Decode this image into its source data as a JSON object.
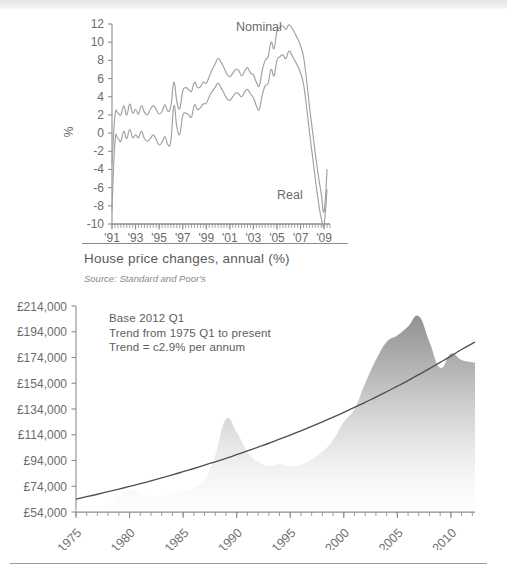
{
  "figure1": {
    "caption": "House price changes, annual (%)",
    "source": "Source: Standard and Poor's",
    "y_axis_label": "%",
    "series_label_nominal": "Nominal",
    "series_label_real": "Real"
  },
  "figure2": {
    "annotation": "Base 2012 Q1\nTrend from 1975 Q1 to present\nTrend = c2.9% per annum"
  },
  "colors": {
    "line": "#9a9a9a",
    "trend": "#4f4f4f",
    "area_top": "#8f8f8f",
    "area_bottom": "#fbfbfb",
    "text": "#5a5a5a",
    "axis": "#8d8d8d"
  },
  "chart_data": [
    {
      "type": "line",
      "title": "House price changes, annual (%)",
      "subtitle": "Source: Standard and Poor's",
      "xlabel": "",
      "ylabel": "%",
      "ylim": [
        -10,
        12
      ],
      "yticks": [
        "12",
        "10",
        "8",
        "6",
        "4",
        "2",
        "0",
        "-2",
        "-4",
        "-6",
        "-8",
        "-10"
      ],
      "ytick_values": [
        12,
        10,
        8,
        6,
        4,
        2,
        0,
        -2,
        -4,
        -6,
        -8,
        -10
      ],
      "xlim": [
        1991,
        2009.5
      ],
      "xticks": [
        "'91",
        "'93",
        "'95",
        "'97",
        "'99",
        "'01",
        "'03",
        "'05",
        "'07",
        "'09"
      ],
      "xtick_values": [
        1991,
        1993,
        1995,
        1997,
        1999,
        2001,
        2003,
        2005,
        2007,
        2009
      ],
      "grid": false,
      "legend": "inline-annotations",
      "x": [
        1991.0,
        1991.25,
        1991.5,
        1991.75,
        1992.0,
        1992.25,
        1992.5,
        1992.75,
        1993.0,
        1993.25,
        1993.5,
        1993.75,
        1994.0,
        1994.25,
        1994.5,
        1994.75,
        1995.0,
        1995.25,
        1995.5,
        1995.75,
        1996.0,
        1996.25,
        1996.5,
        1996.75,
        1997.0,
        1997.25,
        1997.5,
        1997.75,
        1998.0,
        1998.25,
        1998.5,
        1998.75,
        1999.0,
        1999.25,
        1999.5,
        1999.75,
        2000.0,
        2000.25,
        2000.5,
        2000.75,
        2001.0,
        2001.25,
        2001.5,
        2001.75,
        2002.0,
        2002.25,
        2002.5,
        2002.75,
        2003.0,
        2003.25,
        2003.5,
        2003.75,
        2004.0,
        2004.25,
        2004.5,
        2004.75,
        2005.0,
        2005.25,
        2005.5,
        2005.75,
        2006.0,
        2006.25,
        2006.5,
        2006.75,
        2007.0,
        2007.25,
        2007.5,
        2007.75,
        2008.0,
        2008.25,
        2008.5,
        2008.75,
        2009.0,
        2009.25
      ],
      "series": [
        {
          "name": "Nominal",
          "values": [
            -3.4,
            1.9,
            2.2,
            2.0,
            3.0,
            2.0,
            3.2,
            2.2,
            2.6,
            2.1,
            3.0,
            2.3,
            2.0,
            2.6,
            3.0,
            2.6,
            2.1,
            2.4,
            3.1,
            2.4,
            3.0,
            5.6,
            3.5,
            2.7,
            4.6,
            5.0,
            4.8,
            4.6,
            5.6,
            5.0,
            5.1,
            5.6,
            5.5,
            6.2,
            7.0,
            7.6,
            8.2,
            7.8,
            7.2,
            6.5,
            6.2,
            6.6,
            7.0,
            6.9,
            6.3,
            6.8,
            7.2,
            6.6,
            6.4,
            5.6,
            5.2,
            6.9,
            8.0,
            8.4,
            10.0,
            9.3,
            11.2,
            11.6,
            11.8,
            11.4,
            11.9,
            11.6,
            11.0,
            10.4,
            9.6,
            8.4,
            6.0,
            3.0,
            0.4,
            -2.2,
            -4.6,
            -6.6,
            -8.6,
            -4.0
          ]
        },
        {
          "name": "Real",
          "values": [
            -8.4,
            -1.0,
            -0.6,
            -0.9,
            0.2,
            -0.6,
            0.4,
            -0.5,
            -0.2,
            -0.5,
            0.2,
            -0.6,
            -0.9,
            -0.6,
            -0.2,
            -0.7,
            -1.3,
            -1.0,
            -0.4,
            -1.3,
            -0.8,
            3.0,
            0.7,
            -0.1,
            1.9,
            2.2,
            2.0,
            1.8,
            3.1,
            2.6,
            2.8,
            3.2,
            3.3,
            4.0,
            4.6,
            5.0,
            5.5,
            5.0,
            4.4,
            3.8,
            3.6,
            4.0,
            4.4,
            4.3,
            4.0,
            4.5,
            4.8,
            4.3,
            3.9,
            3.0,
            2.6,
            4.2,
            5.2,
            5.5,
            7.0,
            6.3,
            8.0,
            8.4,
            8.6,
            8.2,
            9.0,
            8.6,
            8.0,
            7.4,
            6.6,
            5.4,
            3.0,
            0.2,
            -2.4,
            -5.0,
            -7.4,
            -9.3,
            -10.0,
            -6.2
          ]
        }
      ]
    },
    {
      "type": "area",
      "title": "",
      "xlabel": "",
      "ylabel": "",
      "ylim": [
        54000,
        214000
      ],
      "yticks": [
        "£214,000",
        "£194,000",
        "£174,000",
        "£154,000",
        "£134,000",
        "£114,000",
        "£94,000",
        "£74,000",
        "£54,000"
      ],
      "ytick_values": [
        214000,
        194000,
        174000,
        154000,
        134000,
        114000,
        94000,
        74000,
        54000
      ],
      "xlim": [
        1975,
        2012.25
      ],
      "xticks": [
        "1975",
        "1980",
        "1985",
        "1990",
        "1995",
        "2000",
        "2005",
        "2010"
      ],
      "xtick_values": [
        1975,
        1980,
        1985,
        1990,
        1995,
        2000,
        2005,
        2010
      ],
      "grid": false,
      "annotations": [
        "Base 2012 Q1",
        "Trend from 1975 Q1 to present",
        "Trend = c2.9% per annum"
      ],
      "x": [
        1975,
        1976,
        1977,
        1978,
        1979,
        1980,
        1981,
        1982,
        1983,
        1984,
        1985,
        1986,
        1987,
        1988,
        1989,
        1990,
        1991,
        1992,
        1993,
        1994,
        1995,
        1996,
        1997,
        1998,
        1999,
        2000,
        2001,
        2002,
        2003,
        2004,
        2005,
        2006,
        2007,
        2008,
        2009,
        2010,
        2011,
        2012.25
      ],
      "series": [
        {
          "name": "House price index (real, £)",
          "values": [
            57500,
            57000,
            56800,
            59500,
            66000,
            72000,
            68000,
            65500,
            66500,
            68500,
            70000,
            73000,
            79000,
            98000,
            126000,
            116000,
            101000,
            93000,
            90000,
            91000,
            89500,
            90500,
            95000,
            101000,
            110000,
            124000,
            134000,
            154000,
            172000,
            186000,
            191000,
            198000,
            206000,
            186000,
            166000,
            177000,
            172000,
            170000
          ]
        },
        {
          "name": "Trend = c2.9% per annum",
          "values": [
            64000,
            65900,
            67800,
            69800,
            71800,
            73900,
            76000,
            78200,
            80500,
            82900,
            85300,
            87800,
            90400,
            93000,
            95700,
            98500,
            101400,
            104400,
            107400,
            110600,
            113800,
            117100,
            120500,
            124000,
            127600,
            131400,
            135200,
            139200,
            143200,
            147400,
            151700,
            156100,
            160700,
            165400,
            170200,
            175100,
            180200,
            186000
          ]
        }
      ]
    }
  ]
}
